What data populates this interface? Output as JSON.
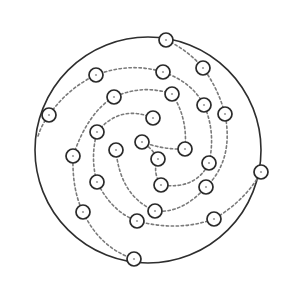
{
  "diagram": {
    "type": "spiral-node-diagram",
    "colors": {
      "background": "#ffffff",
      "boundary": "#2e2e2e",
      "node_stroke": "#2a2a2a",
      "path_stroke": "#7a7a7a"
    },
    "boundary": {
      "cx": 148,
      "cy": 150,
      "r": 113
    },
    "node_radius": 7,
    "nodes": [
      {
        "x": 166,
        "y": 40
      },
      {
        "x": 96,
        "y": 75
      },
      {
        "x": 163,
        "y": 72
      },
      {
        "x": 203,
        "y": 68
      },
      {
        "x": 49,
        "y": 115
      },
      {
        "x": 114,
        "y": 97
      },
      {
        "x": 172,
        "y": 94
      },
      {
        "x": 204,
        "y": 105
      },
      {
        "x": 153,
        "y": 118
      },
      {
        "x": 225,
        "y": 114
      },
      {
        "x": 97,
        "y": 132
      },
      {
        "x": 142,
        "y": 142
      },
      {
        "x": 185,
        "y": 149
      },
      {
        "x": 158,
        "y": 159
      },
      {
        "x": 73,
        "y": 156
      },
      {
        "x": 116,
        "y": 150
      },
      {
        "x": 209,
        "y": 163
      },
      {
        "x": 261,
        "y": 172
      },
      {
        "x": 97,
        "y": 182
      },
      {
        "x": 161,
        "y": 185
      },
      {
        "x": 206,
        "y": 187
      },
      {
        "x": 83,
        "y": 212
      },
      {
        "x": 155,
        "y": 211
      },
      {
        "x": 214,
        "y": 219
      },
      {
        "x": 137,
        "y": 221
      },
      {
        "x": 134,
        "y": 259
      }
    ],
    "paths": [
      "M38,136 Q42,124 49,115 Q68,88 96,75 Q130,62 163,72 Q192,82 204,105 Q216,132 209,163 Q196,190 161,185 Q152,172 158,159 Q152,148 142,142",
      "M166,40 Q188,50 203,68 Q218,88 225,114 Q234,160 206,187 Q182,214 155,211 Q120,196 116,150",
      "M172,94 Q143,84 114,97 Q88,112 73,156 Q72,190 83,212 Q100,248 134,259",
      "M153,118 Q120,104 97,132 Q90,158 97,182 Q112,212 137,221 Q178,232 214,219 Q246,200 261,172",
      "M172,94 Q188,118 185,149 Q164,150 142,142"
    ]
  }
}
